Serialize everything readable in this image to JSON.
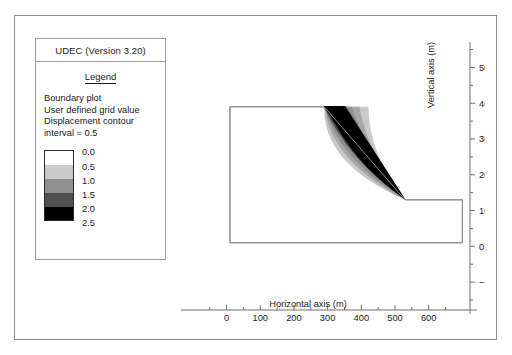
{
  "window": {
    "title": "UDEC (Version 3.20)"
  },
  "legend": {
    "heading": "Legend",
    "lines": [
      "Boundary plot",
      "User defined grid value",
      "Displacement contour",
      "interval = 0.5"
    ],
    "scale_labels": [
      "0.0",
      "0.5",
      "1.0",
      "1.5",
      "2.0",
      "2.5"
    ],
    "scale_colors": [
      "#ffffff",
      "#c9c9c9",
      "#8f8f8f",
      "#4f4f4f",
      "#000000"
    ]
  },
  "chart_data": {
    "type": "contour",
    "title": "UDEC (Version 3.20)",
    "xlabel": "Horizontal axis (m)",
    "ylabel": "Vertical axis (m)",
    "xticks": [
      0,
      100,
      200,
      300,
      400,
      500,
      600
    ],
    "xticklabels": [
      "0",
      "100",
      "200",
      "300",
      "400",
      "500",
      "600"
    ],
    "yticks": [
      -100,
      0,
      100,
      200,
      300,
      400,
      500
    ],
    "yticklabels": [
      "−100",
      "0",
      "100",
      "200",
      "300",
      "400",
      "500"
    ],
    "xlim": [
      -70,
      690
    ],
    "ylim": [
      -150,
      560
    ],
    "minor_tick_step": 50,
    "grid": false,
    "contour_interval": 0.5,
    "contour_levels": [
      0.0,
      0.5,
      1.0,
      1.5,
      2.0,
      2.5
    ],
    "contour_colors": [
      "#ffffff",
      "#c9c9c9",
      "#8f8f8f",
      "#4f4f4f",
      "#000000"
    ],
    "boundary_label": "Boundary plot",
    "boundary_polygon_m": [
      [
        10,
        390
      ],
      [
        290,
        390
      ],
      [
        530,
        130
      ],
      [
        700,
        130
      ],
      [
        700,
        10
      ],
      [
        10,
        10
      ]
    ],
    "slope_face_m": [
      [
        290,
        390
      ],
      [
        530,
        130
      ]
    ],
    "displacement_zone_m": {
      "crest_m": 290,
      "toe_m": 530,
      "max_displacement": 2.5
    }
  }
}
